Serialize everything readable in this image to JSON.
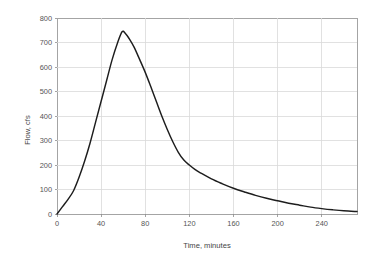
{
  "chart_data": {
    "type": "line",
    "title": "",
    "xlabel": "Time, minutes",
    "ylabel": "Flow, cfs",
    "xlim": [
      0,
      272
    ],
    "ylim": [
      0,
      800
    ],
    "xticks": [
      0,
      40,
      80,
      120,
      160,
      200,
      240
    ],
    "yticks": [
      0,
      100,
      200,
      300,
      400,
      500,
      600,
      700,
      800
    ],
    "grid": true,
    "legend": null,
    "series": [
      {
        "name": "Runoff hydrograph",
        "color": "#1d1d1d",
        "x": [
          0,
          5,
          10,
          15,
          20,
          25,
          30,
          35,
          40,
          45,
          50,
          55,
          59,
          62,
          66,
          70,
          75,
          80,
          85,
          90,
          95,
          100,
          105,
          110,
          115,
          120,
          125,
          130,
          140,
          150,
          160,
          170,
          180,
          190,
          200,
          210,
          220,
          230,
          240,
          250,
          260,
          272
        ],
        "y": [
          0,
          30,
          60,
          95,
          150,
          215,
          290,
          375,
          460,
          545,
          630,
          700,
          744,
          737,
          712,
          680,
          630,
          578,
          520,
          460,
          400,
          345,
          295,
          252,
          220,
          200,
          182,
          168,
          143,
          123,
          105,
          90,
          76,
          64,
          54,
          44,
          36,
          28,
          22,
          17,
          13,
          10
        ]
      }
    ]
  },
  "axes": {
    "ylabel_text": "Flow, cfs",
    "xlabel_text": "Time, minutes",
    "ytick_labels": [
      "800",
      "700",
      "600",
      "500",
      "400",
      "300",
      "200",
      "100",
      "0"
    ],
    "xtick_labels": [
      "0",
      "40",
      "80",
      "120",
      "160",
      "200",
      "240"
    ]
  },
  "colors": {
    "background": "#ffffff",
    "grid": "#d9d9d9",
    "frame": "#9a9a9a",
    "line": "#1d1d1d",
    "text": "#555555"
  }
}
